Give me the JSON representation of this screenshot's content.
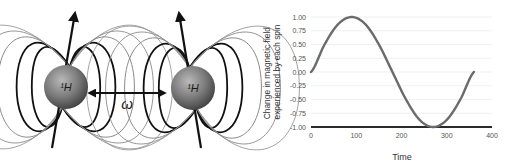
{
  "diagram": {
    "spins": [
      {
        "label": "¹H",
        "cx": 66,
        "cy": 87,
        "r": 22,
        "tip": [
          75,
          13
        ],
        "tail": [
          52,
          148
        ]
      },
      {
        "label": "¹H",
        "cx": 193,
        "cy": 88,
        "r": 22,
        "tip": [
          179,
          13
        ],
        "tail": [
          201,
          148
        ]
      }
    ],
    "coupling_label": "ω"
  },
  "chart_data": {
    "type": "line",
    "title": "",
    "xlabel": "Time",
    "ylabel_lines": [
      "Change in magnetic field",
      "experienced by each spin"
    ],
    "xlim": [
      0,
      400
    ],
    "ylim": [
      -1.0,
      1.0
    ],
    "x_ticks": [
      0,
      100,
      200,
      300,
      400
    ],
    "x_tick_labels": [
      "0",
      "100",
      "200",
      "300",
      "400"
    ],
    "y_ticks": [
      1.0,
      0.75,
      0.5,
      0.25,
      0.0,
      -0.25,
      -0.5,
      -0.75,
      -1.0
    ],
    "y_tick_labels": [
      "1.00",
      "0.75",
      "0.50",
      "0.25",
      "0.00",
      "-0.25",
      "-0.50",
      "-0.75",
      "-1.00"
    ],
    "grid": true,
    "legend": null,
    "series": [
      {
        "name": "sin(time)",
        "x": [
          0,
          30,
          60,
          90,
          120,
          150,
          180,
          210,
          240,
          270,
          300,
          330,
          360
        ],
        "values": [
          0.0,
          0.5,
          0.87,
          1.0,
          0.87,
          0.5,
          0.0,
          -0.5,
          -0.87,
          -1.0,
          -0.87,
          -0.5,
          0.0
        ],
        "color": "#6b6b6b"
      }
    ]
  },
  "colors": {
    "curve": "#6b6b6b",
    "axis": "#2a2a2a",
    "grid": "#ececec",
    "tick_text": "#555555",
    "field_dark": "#111111",
    "field_light": "#8a8a8a"
  }
}
